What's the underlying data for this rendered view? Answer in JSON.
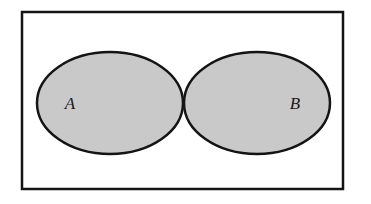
{
  "figure": {
    "type": "venn-diagram",
    "background_color": "#ffffff",
    "universe": {
      "label": "",
      "x": 22,
      "y": 12,
      "width": 321,
      "height": 177,
      "stroke_color": "#141414",
      "stroke_width": 2.5,
      "fill_color": "#ffffff"
    },
    "sets": [
      {
        "label": "A",
        "label_x": 70,
        "label_y": 104,
        "cx": 110,
        "cy": 103,
        "rx": 73,
        "ry": 51,
        "fill_color": "#c9c9c9",
        "stroke_color": "#141414",
        "stroke_width": 2.5,
        "shaded": true
      },
      {
        "label": "B",
        "label_x": 295,
        "label_y": 104,
        "cx": 257,
        "cy": 103,
        "rx": 73,
        "ry": 51,
        "fill_color": "#c9c9c9",
        "stroke_color": "#141414",
        "stroke_width": 2.5,
        "shaded": true
      }
    ],
    "intersection": {
      "shaded": true,
      "fill_color": "#c9c9c9",
      "top_point_x": 183,
      "top_point_y": 70,
      "bottom_point_x": 183,
      "bottom_point_y": 136
    }
  }
}
